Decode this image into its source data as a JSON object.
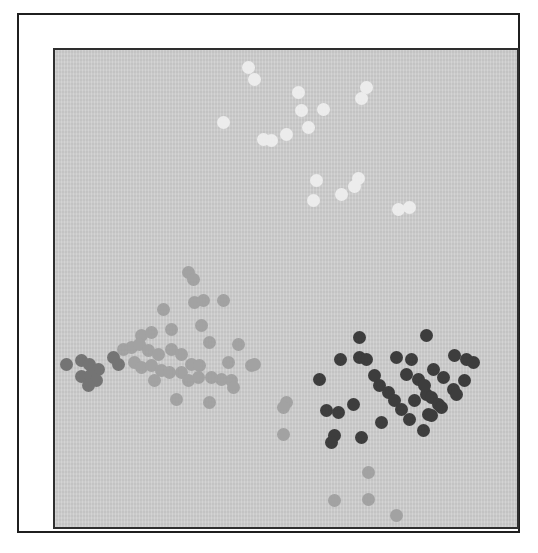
{
  "figure": {
    "page_background_color": "#ffffff",
    "outer_border_color": "#1f1f1f",
    "plot_border_color": "#2e2e2e",
    "plot_background_color": "#cfcfcf"
  },
  "chart_data": {
    "type": "scatter",
    "title": "",
    "xlabel": "",
    "ylabel": "",
    "axes_visible": false,
    "grid": false,
    "legend": false,
    "point_radius_px": 6.5,
    "coordinate_units": "pixels from top-left of plot area (466x481)",
    "series": [
      {
        "name": "cluster-white",
        "color": "#ececec",
        "points": [
          [
            193,
            17
          ],
          [
            199,
            29
          ],
          [
            243,
            42
          ],
          [
            246,
            60
          ],
          [
            268,
            59
          ],
          [
            168,
            72
          ],
          [
            253,
            77
          ],
          [
            231,
            84
          ],
          [
            208,
            89
          ],
          [
            216,
            90
          ],
          [
            311,
            37
          ],
          [
            306,
            48
          ],
          [
            261,
            130
          ],
          [
            303,
            128
          ],
          [
            299,
            136
          ],
          [
            286,
            144
          ],
          [
            258,
            150
          ],
          [
            343,
            159
          ],
          [
            354,
            157
          ]
        ]
      },
      {
        "name": "cluster-light-gray",
        "color": "#a2a2a2",
        "points": [
          [
            133,
            222
          ],
          [
            138,
            229
          ],
          [
            108,
            259
          ],
          [
            139,
            252
          ],
          [
            148,
            250
          ],
          [
            168,
            250
          ],
          [
            146,
            275
          ],
          [
            116,
            279
          ],
          [
            86,
            285
          ],
          [
            96,
            282
          ],
          [
            154,
            292
          ],
          [
            183,
            294
          ],
          [
            68,
            299
          ],
          [
            76,
            297
          ],
          [
            84,
            294
          ],
          [
            93,
            300
          ],
          [
            103,
            304
          ],
          [
            116,
            299
          ],
          [
            126,
            304
          ],
          [
            136,
            314
          ],
          [
            144,
            315
          ],
          [
            173,
            312
          ],
          [
            196,
            315
          ],
          [
            79,
            312
          ],
          [
            86,
            317
          ],
          [
            96,
            315
          ],
          [
            106,
            320
          ],
          [
            114,
            322
          ],
          [
            126,
            322
          ],
          [
            133,
            330
          ],
          [
            143,
            327
          ],
          [
            156,
            327
          ],
          [
            166,
            329
          ],
          [
            176,
            330
          ],
          [
            99,
            330
          ],
          [
            121,
            349
          ],
          [
            154,
            352
          ],
          [
            178,
            337
          ],
          [
            199,
            314
          ],
          [
            231,
            352
          ],
          [
            228,
            357
          ],
          [
            228,
            384
          ],
          [
            313,
            422
          ],
          [
            279,
            450
          ],
          [
            313,
            449
          ],
          [
            341,
            465
          ]
        ]
      },
      {
        "name": "cluster-dark-gray",
        "color": "#747474",
        "points": [
          [
            11,
            314
          ],
          [
            26,
            310
          ],
          [
            34,
            314
          ],
          [
            43,
            319
          ],
          [
            26,
            326
          ],
          [
            35,
            325
          ],
          [
            41,
            330
          ],
          [
            58,
            307
          ],
          [
            63,
            314
          ],
          [
            33,
            335
          ]
        ]
      },
      {
        "name": "cluster-near-black",
        "color": "#3d3d3d",
        "points": [
          [
            304,
            287
          ],
          [
            371,
            285
          ],
          [
            285,
            309
          ],
          [
            304,
            307
          ],
          [
            311,
            309
          ],
          [
            341,
            307
          ],
          [
            356,
            309
          ],
          [
            399,
            305
          ],
          [
            411,
            309
          ],
          [
            418,
            312
          ],
          [
            264,
            329
          ],
          [
            319,
            325
          ],
          [
            324,
            335
          ],
          [
            333,
            342
          ],
          [
            351,
            324
          ],
          [
            363,
            329
          ],
          [
            378,
            319
          ],
          [
            388,
            327
          ],
          [
            409,
            330
          ],
          [
            398,
            339
          ],
          [
            401,
            344
          ],
          [
            371,
            344
          ],
          [
            339,
            350
          ],
          [
            346,
            359
          ],
          [
            359,
            350
          ],
          [
            369,
            335
          ],
          [
            376,
            347
          ],
          [
            383,
            354
          ],
          [
            298,
            354
          ],
          [
            271,
            360
          ],
          [
            283,
            362
          ],
          [
            326,
            372
          ],
          [
            354,
            369
          ],
          [
            373,
            364
          ],
          [
            279,
            385
          ],
          [
            306,
            387
          ],
          [
            368,
            380
          ],
          [
            276,
            392
          ],
          [
            386,
            357
          ],
          [
            376,
            365
          ]
        ]
      }
    ]
  }
}
